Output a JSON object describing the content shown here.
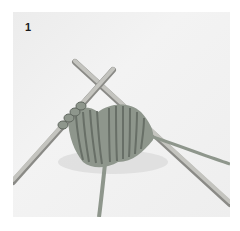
{
  "figure": {
    "step_number": "1",
    "colors": {
      "background": "#f0f0f0",
      "yarn": "#8e968c",
      "yarn_shadow": "#5f665e",
      "needle": "#b9b9b4",
      "needle_shadow": "#8a8a86"
    }
  }
}
